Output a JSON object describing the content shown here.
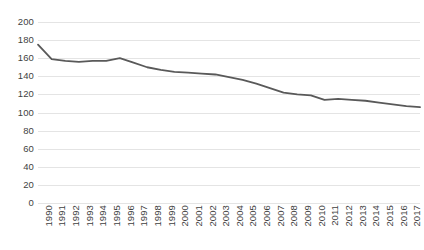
{
  "chart_data": {
    "type": "line",
    "title": "",
    "subtitle": "",
    "xlabel": "",
    "ylabel": "",
    "ylim": [
      0,
      200
    ],
    "yticks": [
      0,
      20,
      40,
      60,
      80,
      100,
      120,
      140,
      160,
      180,
      200
    ],
    "grid": "horizontal",
    "legend": "none",
    "line_color": "#595959",
    "line_width": 1.8,
    "markers": false,
    "categories": [
      "1990",
      "1991",
      "1992",
      "1993",
      "1994",
      "1995",
      "1996",
      "1997",
      "1998",
      "1999",
      "2000",
      "2001",
      "2002",
      "2003",
      "2004",
      "2005",
      "2006",
      "2007",
      "2008",
      "2009",
      "2010",
      "2011",
      "2012",
      "2013",
      "2014",
      "2015",
      "2016",
      "2017",
      "2018"
    ],
    "values": [
      175,
      159,
      157,
      156,
      157,
      157,
      160,
      155,
      150,
      147,
      145,
      144,
      143,
      142,
      139,
      136,
      132,
      127,
      122,
      120,
      119,
      114,
      115,
      114,
      113,
      111,
      109,
      107,
      106
    ],
    "series": [
      {
        "name": "",
        "values": [
          175,
          159,
          157,
          156,
          157,
          157,
          160,
          155,
          150,
          147,
          145,
          144,
          143,
          142,
          139,
          136,
          132,
          127,
          122,
          120,
          119,
          114,
          115,
          114,
          113,
          111,
          109,
          107,
          106
        ]
      }
    ]
  }
}
